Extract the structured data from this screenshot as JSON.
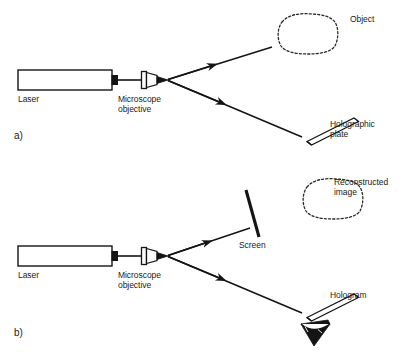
{
  "figure": {
    "title_visible": false,
    "stroke_color": "#141414",
    "background": "#ffffff",
    "panels": [
      {
        "id": "a",
        "label": "a)",
        "caption_role": "hologram-recording-setup",
        "components": [
          {
            "name": "laser",
            "label": "Laser",
            "type": "rectangle-source"
          },
          {
            "name": "microscope-objective",
            "label": "Microscope\nobjective",
            "type": "beam-expander"
          },
          {
            "name": "object",
            "label": "Object",
            "type": "dashed-blob"
          },
          {
            "name": "holographic-plate",
            "label": "Holographic\nplate",
            "type": "tilted-slab"
          }
        ],
        "beams": [
          {
            "name": "object-beam",
            "arrow": true
          },
          {
            "name": "reference-beam",
            "arrow": true
          }
        ]
      },
      {
        "id": "b",
        "label": "b)",
        "caption_role": "hologram-reconstruction-setup",
        "components": [
          {
            "name": "laser",
            "label": "Laser",
            "type": "rectangle-source"
          },
          {
            "name": "microscope-objective",
            "label": "Microscope\nobjective",
            "type": "beam-expander"
          },
          {
            "name": "screen",
            "label": "Screen",
            "type": "thick-line"
          },
          {
            "name": "reconstructed-image",
            "label": "Reconstructed\nimage",
            "type": "dashed-blob"
          },
          {
            "name": "hologram",
            "label": "Hologram",
            "type": "tilted-slab"
          },
          {
            "name": "observer-eye",
            "label": "",
            "type": "eye-symbol"
          }
        ],
        "beams": [
          {
            "name": "upper-beam",
            "arrow": true
          },
          {
            "name": "lower-beam",
            "arrow": true
          }
        ]
      }
    ]
  },
  "labels": {
    "panel_a": "a)",
    "panel_b": "b)",
    "laser_a": "Laser",
    "laser_b": "Laser",
    "objective_a": "Microscope\nobjective",
    "objective_b": "Microscope\nobjective",
    "object": "Object",
    "holographic_plate": "Holographic\nplate",
    "screen": "Screen",
    "reconstructed_image": "Reconstructed\nimage",
    "hologram": "Hologram"
  }
}
